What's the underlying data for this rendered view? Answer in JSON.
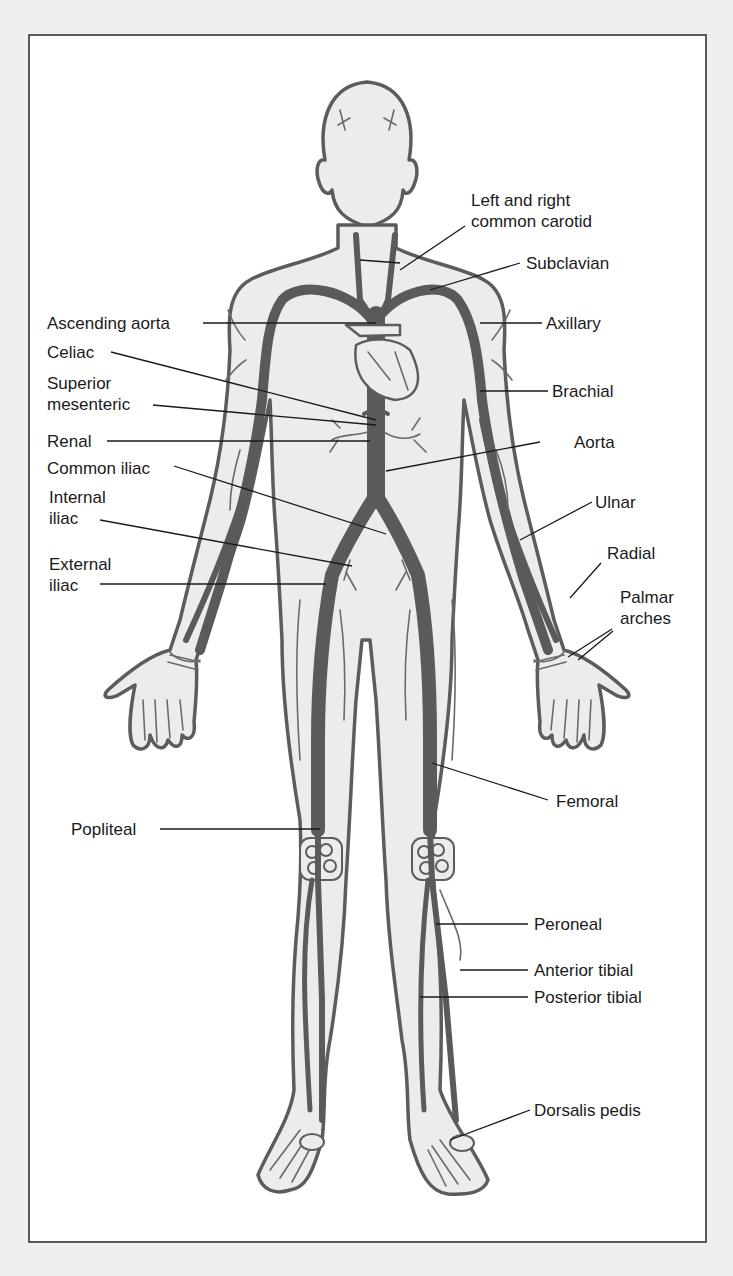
{
  "figure": {
    "colors": {
      "background": "#efefef",
      "panel": "#ffffff",
      "body_fill": "#ececec",
      "outline": "#5c5c5c",
      "artery": "#5a5a5a",
      "text": "#1a1a1a"
    }
  },
  "labels": {
    "left": [
      {
        "id": "ascending-aorta",
        "lines": [
          "Ascending aorta"
        ]
      },
      {
        "id": "celiac",
        "lines": [
          "Celiac"
        ]
      },
      {
        "id": "superior-mesenteric",
        "lines": [
          "Superior",
          "mesenteric"
        ]
      },
      {
        "id": "renal",
        "lines": [
          "Renal"
        ]
      },
      {
        "id": "common-iliac",
        "lines": [
          "Common iliac"
        ]
      },
      {
        "id": "internal-iliac",
        "lines": [
          "Internal",
          "iliac"
        ]
      },
      {
        "id": "external-iliac",
        "lines": [
          "External",
          "iliac"
        ]
      },
      {
        "id": "popliteal",
        "lines": [
          "Popliteal"
        ]
      }
    ],
    "right": [
      {
        "id": "common-carotid",
        "lines": [
          "Left and right",
          "common carotid"
        ]
      },
      {
        "id": "subclavian",
        "lines": [
          "Subclavian"
        ]
      },
      {
        "id": "axillary",
        "lines": [
          "Axillary"
        ]
      },
      {
        "id": "brachial",
        "lines": [
          "Brachial"
        ]
      },
      {
        "id": "aorta",
        "lines": [
          "Aorta"
        ]
      },
      {
        "id": "ulnar",
        "lines": [
          "Ulnar"
        ]
      },
      {
        "id": "radial",
        "lines": [
          "Radial"
        ]
      },
      {
        "id": "palmar-arches",
        "lines": [
          "Palmar",
          "arches"
        ]
      },
      {
        "id": "femoral",
        "lines": [
          "Femoral"
        ]
      },
      {
        "id": "peroneal",
        "lines": [
          "Peroneal"
        ]
      },
      {
        "id": "anterior-tibial",
        "lines": [
          "Anterior tibial"
        ]
      },
      {
        "id": "posterior-tibial",
        "lines": [
          "Posterior tibial"
        ]
      },
      {
        "id": "dorsalis-pedis",
        "lines": [
          "Dorsalis pedis"
        ]
      }
    ]
  }
}
